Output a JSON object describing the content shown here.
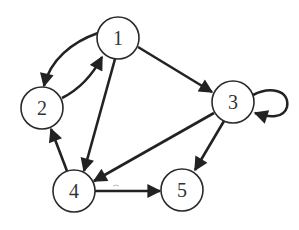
{
  "diagram": {
    "type": "directed-graph",
    "nodes": [
      {
        "id": "1",
        "label": "1",
        "x": 118,
        "y": 38
      },
      {
        "id": "2",
        "label": "2",
        "x": 42,
        "y": 108
      },
      {
        "id": "3",
        "label": "3",
        "x": 233,
        "y": 102
      },
      {
        "id": "4",
        "label": "4",
        "x": 74,
        "y": 191
      },
      {
        "id": "5",
        "label": "5",
        "x": 182,
        "y": 190
      }
    ],
    "edges": [
      {
        "from": "1",
        "to": "2"
      },
      {
        "from": "2",
        "to": "1"
      },
      {
        "from": "1",
        "to": "3"
      },
      {
        "from": "1",
        "to": "4"
      },
      {
        "from": "3",
        "to": "3"
      },
      {
        "from": "3",
        "to": "4"
      },
      {
        "from": "3",
        "to": "5"
      },
      {
        "from": "4",
        "to": "2"
      },
      {
        "from": "4",
        "to": "5"
      }
    ],
    "colors": {
      "stroke": "#222222",
      "fill": "#ffffff",
      "text": "#333333"
    }
  }
}
